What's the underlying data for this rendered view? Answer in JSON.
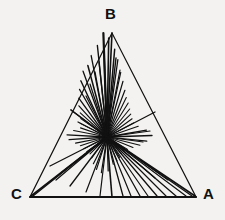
{
  "figure": {
    "type": "geometric-diagram",
    "title": "",
    "background_color": "#f3f2f0",
    "ink_color": "#111111",
    "canvas": {
      "width": 225,
      "height": 220
    },
    "triangle": {
      "name": "triangle-ABC",
      "stroke_width": 1.2,
      "vertices": [
        {
          "label": "B",
          "x": 112,
          "y": 33
        },
        {
          "label": "C",
          "x": 30,
          "y": 197
        },
        {
          "label": "A",
          "x": 196,
          "y": 197
        }
      ]
    },
    "base_edge": {
      "name": "edge-CA",
      "stroke_width": 2.2,
      "from": {
        "x": 30,
        "y": 197
      },
      "to": {
        "x": 196,
        "y": 197
      }
    },
    "convergence_point": {
      "x": 107,
      "y": 137
    },
    "cevians": [
      {
        "name": "cevian-to-B",
        "to_x": 112,
        "to_y": 33,
        "stroke_width": 1.6
      },
      {
        "name": "cevian-to-edge-AB",
        "to_x": 155,
        "to_y": 112,
        "stroke_width": 1.3
      },
      {
        "name": "cevian-to-edge-BC",
        "to_x": 71,
        "to_y": 110,
        "stroke_width": 1.3
      },
      {
        "name": "cevian-to-base",
        "to_x": 112,
        "to_y": 197,
        "stroke_width": 1.6
      }
    ],
    "rays": [
      {
        "angle_deg": 268,
        "length": 104,
        "width": 2.2
      },
      {
        "angle_deg": 271,
        "length": 99,
        "width": 1.6
      },
      {
        "angle_deg": 264,
        "length": 92,
        "width": 1.4
      },
      {
        "angle_deg": 275,
        "length": 88,
        "width": 1.5
      },
      {
        "angle_deg": 259,
        "length": 83,
        "width": 1.3
      },
      {
        "angle_deg": 278,
        "length": 78,
        "width": 1.3
      },
      {
        "angle_deg": 255,
        "length": 74,
        "width": 1.5
      },
      {
        "angle_deg": 282,
        "length": 66,
        "width": 1.2
      },
      {
        "angle_deg": 250,
        "length": 70,
        "width": 1.3
      },
      {
        "angle_deg": 286,
        "length": 58,
        "width": 1.2
      },
      {
        "angle_deg": 245,
        "length": 62,
        "width": 1.4
      },
      {
        "angle_deg": 240,
        "length": 55,
        "width": 1.2
      },
      {
        "angle_deg": 291,
        "length": 50,
        "width": 1.2
      },
      {
        "angle_deg": 234,
        "length": 48,
        "width": 1.3
      },
      {
        "angle_deg": 296,
        "length": 44,
        "width": 1.1
      },
      {
        "angle_deg": 228,
        "length": 42,
        "width": 1.2
      },
      {
        "angle_deg": 302,
        "length": 40,
        "width": 1.1
      },
      {
        "angle_deg": 222,
        "length": 36,
        "width": 1.1
      },
      {
        "angle_deg": 309,
        "length": 36,
        "width": 1.1
      },
      {
        "angle_deg": 215,
        "length": 32,
        "width": 1.1
      },
      {
        "angle_deg": 316,
        "length": 33,
        "width": 1.1
      },
      {
        "angle_deg": 207,
        "length": 30,
        "width": 1.1
      },
      {
        "angle_deg": 324,
        "length": 31,
        "width": 1.1
      },
      {
        "angle_deg": 199,
        "length": 28,
        "width": 1.1
      },
      {
        "angle_deg": 332,
        "length": 30,
        "width": 1.1
      },
      {
        "angle_deg": 191,
        "length": 34,
        "width": 1.2
      },
      {
        "angle_deg": 341,
        "length": 33,
        "width": 1.2
      },
      {
        "angle_deg": 183,
        "length": 40,
        "width": 1.3
      },
      {
        "angle_deg": 350,
        "length": 40,
        "width": 1.3
      },
      {
        "angle_deg": 176,
        "length": 38,
        "width": 1.3
      },
      {
        "angle_deg": 358,
        "length": 45,
        "width": 1.4
      },
      {
        "angle_deg": 169,
        "length": 32,
        "width": 1.2
      },
      {
        "angle_deg": 6,
        "length": 40,
        "width": 1.2
      },
      {
        "angle_deg": 162,
        "length": 28,
        "width": 1.1
      },
      {
        "angle_deg": 14,
        "length": 34,
        "width": 1.1
      },
      {
        "angle_deg": 153,
        "length": 26,
        "width": 1.1
      },
      {
        "angle_deg": 22,
        "length": 28,
        "width": 1.1
      },
      {
        "angle_deg": 144,
        "length": 25,
        "width": 1.1
      },
      {
        "angle_deg": 31,
        "length": 24,
        "width": 1.1
      },
      {
        "angle_deg": 135,
        "length": 24,
        "width": 1.1
      },
      {
        "angle_deg": 40,
        "length": 22,
        "width": 1.1
      },
      {
        "angle_deg": 126,
        "length": 26,
        "width": 1.1
      },
      {
        "angle_deg": 49,
        "length": 22,
        "width": 1.1
      },
      {
        "angle_deg": 117,
        "length": 30,
        "width": 1.2
      },
      {
        "angle_deg": 58,
        "length": 24,
        "width": 1.1
      },
      {
        "angle_deg": 108,
        "length": 34,
        "width": 1.2
      },
      {
        "angle_deg": 67,
        "length": 26,
        "width": 1.1
      },
      {
        "angle_deg": 99,
        "length": 36,
        "width": 1.2
      },
      {
        "angle_deg": 77,
        "length": 28,
        "width": 1.1
      },
      {
        "angle_deg": 88,
        "length": 34,
        "width": 1.2
      }
    ],
    "long_rays": [
      {
        "name": "ray-to-C",
        "to_x": 31,
        "to_y": 196,
        "width": 1.6
      },
      {
        "name": "ray-to-C-2",
        "to_x": 33,
        "to_y": 196,
        "width": 1.3
      },
      {
        "name": "ray-to-A",
        "to_x": 195,
        "to_y": 196,
        "width": 1.6
      },
      {
        "name": "ray-to-A-2",
        "to_x": 192,
        "to_y": 196,
        "width": 1.3
      },
      {
        "name": "ray-to-A-3",
        "to_x": 186,
        "to_y": 196,
        "width": 1.2
      },
      {
        "name": "ray-base-1",
        "to_x": 176,
        "to_y": 196,
        "width": 1.3
      },
      {
        "name": "ray-base-2",
        "to_x": 166,
        "to_y": 196,
        "width": 1.2
      },
      {
        "name": "ray-base-3",
        "to_x": 157,
        "to_y": 196,
        "width": 1.3
      },
      {
        "name": "ray-base-4",
        "to_x": 148,
        "to_y": 196,
        "width": 1.2
      },
      {
        "name": "ray-base-5",
        "to_x": 140,
        "to_y": 196,
        "width": 1.3
      },
      {
        "name": "ray-base-6",
        "to_x": 131,
        "to_y": 196,
        "width": 1.2
      },
      {
        "name": "ray-base-7",
        "to_x": 123,
        "to_y": 196,
        "width": 1.3
      },
      {
        "name": "ray-base-8",
        "to_x": 100,
        "to_y": 196,
        "width": 1.2
      },
      {
        "name": "ray-lower-left-1",
        "to_x": 86,
        "to_y": 192,
        "width": 1.2
      },
      {
        "name": "ray-lower-left-2",
        "to_x": 70,
        "to_y": 186,
        "width": 1.3
      },
      {
        "name": "ray-lower-left-3",
        "to_x": 56,
        "to_y": 180,
        "width": 1.2
      },
      {
        "name": "ray-lower-left-4",
        "to_x": 62,
        "to_y": 172,
        "width": 1.2
      },
      {
        "name": "ray-lower-left-5",
        "to_x": 50,
        "to_y": 166,
        "width": 1.3
      },
      {
        "name": "ray-lower-right-1",
        "to_x": 168,
        "to_y": 180,
        "width": 1.2
      },
      {
        "name": "ray-lower-right-2",
        "to_x": 155,
        "to_y": 178,
        "width": 1.2
      },
      {
        "name": "ray-upper-1",
        "to_x": 104,
        "to_y": 52,
        "width": 1.6
      },
      {
        "name": "ray-upper-2",
        "to_x": 99,
        "to_y": 62,
        "width": 1.3
      },
      {
        "name": "ray-upper-3",
        "to_x": 95,
        "to_y": 72,
        "width": 1.3
      },
      {
        "name": "ray-upper-4",
        "to_x": 90,
        "to_y": 84,
        "width": 1.2
      },
      {
        "name": "ray-upper-5",
        "to_x": 116,
        "to_y": 58,
        "width": 1.4
      },
      {
        "name": "ray-upper-6",
        "to_x": 120,
        "to_y": 70,
        "width": 1.2
      },
      {
        "name": "ray-upper-7",
        "to_x": 86,
        "to_y": 96,
        "width": 1.2
      },
      {
        "name": "ray-left-1",
        "to_x": 71,
        "to_y": 110,
        "width": 1.3
      },
      {
        "name": "ray-left-2",
        "to_x": 78,
        "to_y": 122,
        "width": 1.2
      },
      {
        "name": "ray-right-1",
        "to_x": 150,
        "to_y": 131,
        "width": 1.2
      },
      {
        "name": "ray-right-2",
        "to_x": 143,
        "to_y": 142,
        "width": 1.2
      }
    ],
    "labels": {
      "apex": "B",
      "bottom_left": "C",
      "bottom_right": "A"
    }
  }
}
